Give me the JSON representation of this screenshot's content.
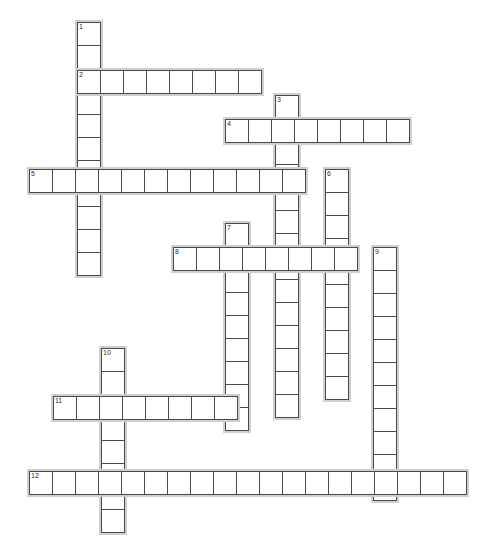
{
  "puzzle": {
    "type": "crossword-grid",
    "title": "Crossword Puzzle Grid",
    "cell_size_px": 24,
    "grid_background": "#ffffff",
    "cell_border_color": "#4a4a4a",
    "entry_shadow_color": "#cfcfcf",
    "number_color": "#2b2b2b",
    "entries": [
      {
        "number": "1",
        "direction": "down",
        "length": 11,
        "x": 75,
        "y": 20,
        "cells": [
          "",
          "",
          "",
          "",
          "",
          "",
          "",
          "",
          "",
          "",
          ""
        ]
      },
      {
        "number": "2",
        "direction": "across",
        "length": 8,
        "x": 75,
        "y": 68,
        "cells": [
          "",
          "",
          "",
          "",
          "",
          "",
          "",
          ""
        ]
      },
      {
        "number": "3",
        "direction": "down",
        "length": 14,
        "x": 273,
        "y": 93,
        "cells": [
          "",
          "",
          "",
          "",
          "",
          "",
          "",
          "",
          "",
          "",
          "",
          "",
          "",
          ""
        ]
      },
      {
        "number": "4",
        "direction": "across",
        "length": 8,
        "x": 223,
        "y": 117,
        "cells": [
          "",
          "",
          "",
          "",
          "",
          "",
          "",
          ""
        ]
      },
      {
        "number": "5",
        "direction": "across",
        "length": 12,
        "x": 27,
        "y": 167,
        "cells": [
          "",
          "",
          "",
          "",
          "",
          "",
          "",
          "",
          "",
          "",
          "",
          ""
        ]
      },
      {
        "number": "6",
        "direction": "down",
        "length": 10,
        "x": 323,
        "y": 167,
        "cells": [
          "",
          "",
          "",
          "",
          "",
          "",
          "",
          "",
          "",
          ""
        ]
      },
      {
        "number": "7",
        "direction": "down",
        "length": 9,
        "x": 223,
        "y": 221,
        "cells": [
          "",
          "",
          "",
          "",
          "",
          "",
          "",
          "",
          ""
        ]
      },
      {
        "number": "8",
        "direction": "across",
        "length": 8,
        "x": 171,
        "y": 245,
        "cells": [
          "",
          "",
          "",
          "",
          "",
          "",
          "",
          ""
        ]
      },
      {
        "number": "9",
        "direction": "down",
        "length": 11,
        "x": 371,
        "y": 245,
        "cells": [
          "",
          "",
          "",
          "",
          "",
          "",
          "",
          "",
          "",
          "",
          ""
        ]
      },
      {
        "number": "10",
        "direction": "down",
        "length": 8,
        "x": 99,
        "y": 346,
        "cells": [
          "",
          "",
          "",
          "",
          "",
          "",
          "",
          ""
        ]
      },
      {
        "number": "11",
        "direction": "across",
        "length": 8,
        "x": 51,
        "y": 394,
        "cells": [
          "",
          "",
          "",
          "",
          "",
          "",
          "",
          ""
        ]
      },
      {
        "number": "12",
        "direction": "across",
        "length": 19,
        "x": 27,
        "y": 469,
        "cells": [
          "",
          "",
          "",
          "",
          "",
          "",
          "",
          "",
          "",
          "",
          "",
          "",
          "",
          "",
          "",
          "",
          "",
          "",
          ""
        ]
      }
    ]
  }
}
